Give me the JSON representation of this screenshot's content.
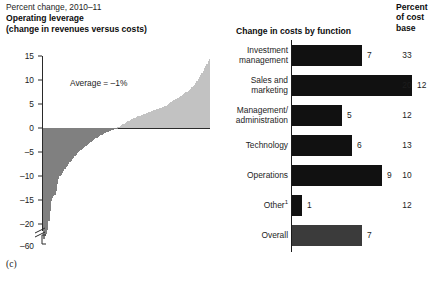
{
  "left_panel": {
    "super_label": "Percent change, 2010–11",
    "title_line1": "Operating leverage",
    "title_line2": "(change in revenues versus costs)",
    "annotation": "Average = –1%",
    "panel_letter": "(c)"
  },
  "right_panel": {
    "title": "Change in costs by function",
    "pct_header_line1": "Percent",
    "pct_header_line2": "of cost",
    "pct_header_line3": "base"
  },
  "footer": {
    "cropped_note": ""
  },
  "colors": {
    "negative_bar": "#808080",
    "positive_bar": "#c2c2c2",
    "right_bar": "#111111",
    "overall_bar": "#3b3b3b",
    "axis": "#2a2a2a"
  },
  "chart_data": [
    {
      "type": "bar",
      "id": "operating-leverage-distribution",
      "title": "Operating leverage (change in revenues versus costs)",
      "subtitle": "Percent change, 2010–11",
      "xlabel": "",
      "ylabel": "Percent change, 2010–11",
      "grid": false,
      "legend": "none",
      "orientation": "vertical",
      "ylim": [
        -60,
        15
      ],
      "axis_break": {
        "between": [
          -22,
          -55
        ],
        "label_low": "–60"
      },
      "ytick_labels": [
        "15",
        "10",
        "5",
        "0",
        "–5",
        "–10",
        "–15",
        "–20",
        "–60"
      ],
      "ytick_values": [
        15,
        10,
        5,
        0,
        -5,
        -10,
        -15,
        -20,
        -60
      ],
      "annotations": [
        {
          "text": "Average = –1%",
          "value": -1
        }
      ],
      "description": "Sorted distribution of per-firm operating leverage, ascending left to right; negative values shaded dark gray, positive values light gray.",
      "values": [
        -56,
        -22.5,
        -22.1,
        -21.3,
        -19.4,
        -17.2,
        -15.3,
        -14.6,
        -14.2,
        -13.9,
        -13.1,
        -11.7,
        -10.6,
        -10.1,
        -9.7,
        -9.3,
        -9.0,
        -8.6,
        -8.2,
        -7.9,
        -7.5,
        -7.1,
        -6.8,
        -6.5,
        -6.2,
        -5.9,
        -5.6,
        -5.3,
        -5.0,
        -4.8,
        -4.5,
        -4.3,
        -4.1,
        -3.9,
        -3.7,
        -3.5,
        -3.3,
        -3.1,
        -2.9,
        -2.7,
        -2.5,
        -2.3,
        -2.1,
        -2.0,
        -1.8,
        -1.7,
        -1.5,
        -1.4,
        -1.2,
        -1.1,
        -1.0,
        -0.9,
        -0.8,
        -0.7,
        -0.6,
        -0.5,
        -0.4,
        -0.3,
        -0.2,
        -0.1,
        0.2,
        0.3,
        0.5,
        0.6,
        0.8,
        0.9,
        1.1,
        1.2,
        1.4,
        1.5,
        1.6,
        1.8,
        1.9,
        2.0,
        2.1,
        2.2,
        2.4,
        2.5,
        2.6,
        2.7,
        2.8,
        2.9,
        3.0,
        3.1,
        3.2,
        3.3,
        3.4,
        3.5,
        3.6,
        3.7,
        3.8,
        3.9,
        4.0,
        4.0,
        4.1,
        4.2,
        4.3,
        4.4,
        4.5,
        4.6,
        4.8,
        5.1,
        5.3,
        5.5,
        5.6,
        5.8,
        5.9,
        6.0,
        6.2,
        6.3,
        6.5,
        6.6,
        6.8,
        7.0,
        7.2,
        7.4,
        7.6,
        7.8,
        8.0,
        8.2,
        8.5,
        8.7,
        9.0,
        9.4,
        9.8,
        10.2,
        10.6,
        11.0,
        11.4,
        11.9,
        12.4,
        12.9,
        13.4,
        13.9,
        14.4
      ],
      "average": -1
    },
    {
      "type": "bar",
      "id": "change-in-costs-by-function",
      "title": "Change in costs by function",
      "orientation": "horizontal",
      "xlabel": "Percent change, 2010–11",
      "ylabel": "",
      "grid": false,
      "legend": "none",
      "xlim": [
        0,
        13
      ],
      "categories": [
        "Investment management",
        "Sales and marketing",
        "Management/ administration",
        "Technology",
        "Operations",
        "Other",
        "Overall"
      ],
      "values": [
        7,
        12,
        5,
        6,
        9,
        1,
        7
      ],
      "value_labels": [
        "7",
        "12",
        "5",
        "6",
        "9",
        "1",
        "7"
      ],
      "secondary_column": {
        "header": "Percent of cost base",
        "values": [
          33,
          20,
          12,
          13,
          10,
          12,
          null
        ],
        "labels": [
          "33",
          "20",
          "12",
          "13",
          "10",
          "12",
          ""
        ]
      }
    }
  ],
  "right_rows": [
    {
      "label_line1": "Investment",
      "label_line2": "management",
      "value_label": "7",
      "pct_label": "33",
      "footnote": ""
    },
    {
      "label_line1": "Sales and",
      "label_line2": "marketing",
      "value_label": "12",
      "pct_label": "20",
      "footnote": ""
    },
    {
      "label_line1": "Management/",
      "label_line2": "administration",
      "value_label": "5",
      "pct_label": "12",
      "footnote": ""
    },
    {
      "label_line1": "Technology",
      "label_line2": "",
      "value_label": "6",
      "pct_label": "13",
      "footnote": ""
    },
    {
      "label_line1": "Operations",
      "label_line2": "",
      "value_label": "9",
      "pct_label": "10",
      "footnote": ""
    },
    {
      "label_line1": "Other",
      "label_line2": "",
      "value_label": "1",
      "pct_label": "12",
      "footnote": "1"
    },
    {
      "label_line1": "Overall",
      "label_line2": "",
      "value_label": "7",
      "pct_label": "",
      "footnote": ""
    }
  ]
}
